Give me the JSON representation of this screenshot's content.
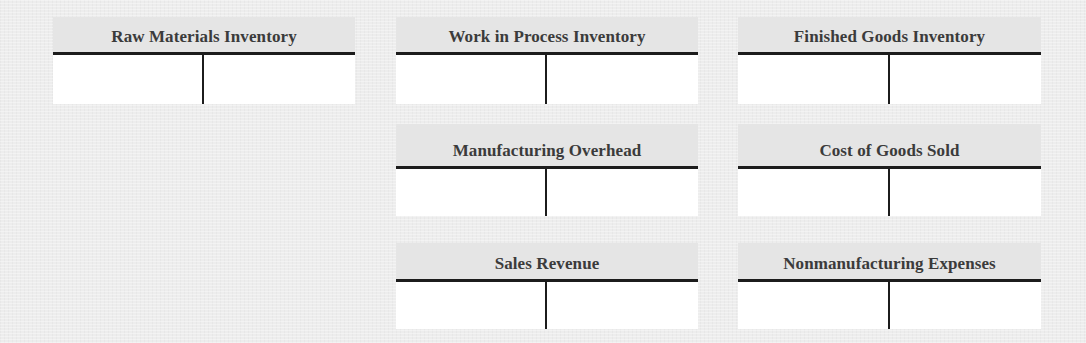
{
  "diagram": {
    "type": "t-accounts",
    "accounts": [
      {
        "id": "raw-materials-inventory",
        "title": "Raw Materials Inventory",
        "row": 1,
        "col": 1,
        "debit_entries": [],
        "credit_entries": []
      },
      {
        "id": "work-in-process-inventory",
        "title": "Work in Process Inventory",
        "row": 1,
        "col": 2,
        "debit_entries": [],
        "credit_entries": []
      },
      {
        "id": "finished-goods-inventory",
        "title": "Finished Goods Inventory",
        "row": 1,
        "col": 3,
        "debit_entries": [],
        "credit_entries": []
      },
      {
        "id": "manufacturing-overhead",
        "title": "Manufacturing Overhead",
        "row": 2,
        "col": 2,
        "debit_entries": [],
        "credit_entries": []
      },
      {
        "id": "cost-of-goods-sold",
        "title": "Cost of Goods Sold",
        "row": 2,
        "col": 3,
        "debit_entries": [],
        "credit_entries": []
      },
      {
        "id": "sales-revenue",
        "title": "Sales Revenue",
        "row": 3,
        "col": 2,
        "debit_entries": [],
        "credit_entries": []
      },
      {
        "id": "nonmanufacturing-expenses",
        "title": "Nonmanufacturing Expenses",
        "row": 3,
        "col": 3,
        "debit_entries": [],
        "credit_entries": []
      }
    ]
  },
  "colors": {
    "background": "#ededed",
    "header_band": "#e5e5e5",
    "body": "#ffffff",
    "rule": "#1c1c1c",
    "title_text": "#3b3b3b"
  }
}
